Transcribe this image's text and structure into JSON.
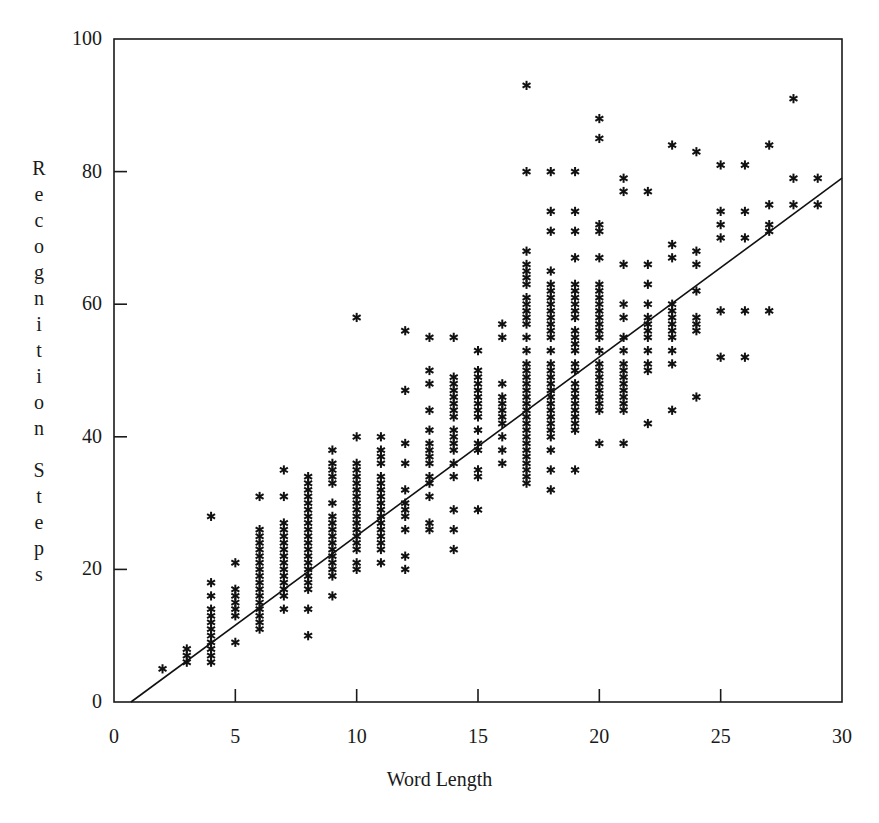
{
  "figure": {
    "background": "#ffffff",
    "ink_color": "#1a1a1a"
  },
  "axis": {
    "x_title": "Word Length",
    "y_title": "Recognition Steps",
    "y_title_letters": [
      "R",
      "e",
      "c",
      "o",
      "g",
      "n",
      "i",
      "t",
      "i",
      "o",
      "n",
      "",
      "S",
      "t",
      "e",
      "p",
      "s"
    ],
    "x_ticks": [
      "0",
      "5",
      "10",
      "15",
      "20",
      "25",
      "30"
    ],
    "y_ticks": [
      "0",
      "20",
      "40",
      "60",
      "80",
      "100"
    ]
  },
  "chart_data": {
    "type": "scatter",
    "title": "",
    "xlabel": "Word Length",
    "ylabel": "Recognition Steps",
    "xlim": [
      0,
      30
    ],
    "ylim": [
      0,
      100
    ],
    "xticks": [
      0,
      5,
      10,
      15,
      20,
      25,
      30
    ],
    "yticks": [
      0,
      20,
      40,
      60,
      80,
      100
    ],
    "grid": false,
    "legend": "none",
    "marker": "asterisk",
    "marker_color": "#111111",
    "frame": "box",
    "tick_direction": "in",
    "trendline": {
      "label": "regression line",
      "x": [
        0.7,
        30.0
      ],
      "y": [
        0.0,
        79.0
      ],
      "slope": 2.7,
      "intercept": -1.9,
      "color": "#111111",
      "width": 1.6
    },
    "columns": [
      {
        "x": 2,
        "y": [
          5
        ]
      },
      {
        "x": 3,
        "y": [
          6,
          7,
          8
        ]
      },
      {
        "x": 4,
        "y": [
          6,
          7,
          8,
          9,
          10,
          11,
          12,
          13,
          14,
          16,
          18,
          28
        ]
      },
      {
        "x": 5,
        "y": [
          9,
          13,
          14,
          15,
          16,
          17,
          21
        ]
      },
      {
        "x": 6,
        "y": [
          11,
          12,
          13,
          14,
          15,
          16,
          17,
          18,
          19,
          20,
          21,
          22,
          23,
          24,
          25,
          26,
          31
        ]
      },
      {
        "x": 7,
        "y": [
          14,
          16,
          17,
          18,
          19,
          20,
          21,
          22,
          23,
          24,
          25,
          26,
          27,
          31,
          35
        ]
      },
      {
        "x": 8,
        "y": [
          10,
          14,
          17,
          18,
          19,
          20,
          21,
          22,
          23,
          24,
          25,
          26,
          27,
          28,
          29,
          30,
          31,
          32,
          33,
          34
        ]
      },
      {
        "x": 9,
        "y": [
          16,
          19,
          20,
          21,
          22,
          23,
          24,
          25,
          26,
          27,
          28,
          30,
          33,
          34,
          35,
          36,
          38
        ]
      },
      {
        "x": 10,
        "y": [
          20,
          21,
          23,
          24,
          25,
          26,
          27,
          28,
          29,
          30,
          31,
          32,
          33,
          34,
          35,
          36,
          40,
          58
        ]
      },
      {
        "x": 11,
        "y": [
          21,
          23,
          24,
          25,
          26,
          27,
          28,
          29,
          30,
          31,
          32,
          33,
          34,
          36,
          37,
          38,
          40
        ]
      },
      {
        "x": 12,
        "y": [
          20,
          22,
          26,
          28,
          29,
          30,
          32,
          36,
          39,
          47,
          56
        ]
      },
      {
        "x": 13,
        "y": [
          26,
          27,
          31,
          33,
          34,
          36,
          37,
          38,
          39,
          41,
          44,
          48,
          50,
          55
        ]
      },
      {
        "x": 14,
        "y": [
          23,
          26,
          29,
          34,
          36,
          38,
          39,
          40,
          41,
          43,
          44,
          45,
          46,
          47,
          48,
          49,
          55
        ]
      },
      {
        "x": 15,
        "y": [
          29,
          34,
          35,
          38,
          39,
          41,
          43,
          44,
          45,
          46,
          47,
          48,
          49,
          50,
          53
        ]
      },
      {
        "x": 16,
        "y": [
          36,
          38,
          40,
          42,
          43,
          44,
          45,
          46,
          48,
          55,
          57
        ]
      },
      {
        "x": 17,
        "y": [
          33,
          34,
          35,
          36,
          37,
          38,
          39,
          40,
          41,
          42,
          43,
          44,
          45,
          46,
          47,
          48,
          49,
          50,
          51,
          53,
          55,
          57,
          58,
          59,
          60,
          61,
          63,
          64,
          65,
          66,
          68,
          80,
          93
        ]
      },
      {
        "x": 18,
        "y": [
          32,
          35,
          38,
          40,
          41,
          42,
          43,
          44,
          45,
          46,
          47,
          48,
          49,
          50,
          51,
          53,
          55,
          56,
          57,
          58,
          59,
          60,
          61,
          62,
          63,
          65,
          71,
          74,
          80
        ]
      },
      {
        "x": 19,
        "y": [
          35,
          41,
          42,
          43,
          44,
          45,
          46,
          47,
          48,
          50,
          51,
          53,
          54,
          55,
          56,
          58,
          59,
          60,
          61,
          62,
          63,
          67,
          71,
          74,
          80
        ]
      },
      {
        "x": 20,
        "y": [
          39,
          44,
          45,
          46,
          47,
          48,
          49,
          50,
          51,
          53,
          55,
          56,
          57,
          58,
          59,
          60,
          61,
          62,
          63,
          67,
          71,
          72,
          85,
          88
        ]
      },
      {
        "x": 21,
        "y": [
          39,
          44,
          45,
          46,
          47,
          48,
          49,
          50,
          51,
          53,
          55,
          58,
          60,
          66,
          77,
          79
        ]
      },
      {
        "x": 22,
        "y": [
          42,
          50,
          51,
          53,
          55,
          56,
          57,
          58,
          60,
          63,
          66,
          77
        ]
      },
      {
        "x": 23,
        "y": [
          44,
          51,
          53,
          55,
          56,
          57,
          58,
          59,
          60,
          67,
          69,
          84
        ]
      },
      {
        "x": 24,
        "y": [
          46,
          56,
          57,
          58,
          62,
          66,
          68,
          83
        ]
      },
      {
        "x": 25,
        "y": [
          52,
          59,
          70,
          72,
          74,
          81
        ]
      },
      {
        "x": 26,
        "y": [
          52,
          59,
          70,
          74,
          81
        ]
      },
      {
        "x": 27,
        "y": [
          59,
          71,
          72,
          75,
          84
        ]
      },
      {
        "x": 28,
        "y": [
          75,
          79,
          91
        ]
      },
      {
        "x": 29,
        "y": [
          75,
          79
        ]
      }
    ]
  },
  "geometry": {
    "plot_left": 114,
    "plot_right": 842,
    "plot_top": 39,
    "plot_bottom": 702
  }
}
